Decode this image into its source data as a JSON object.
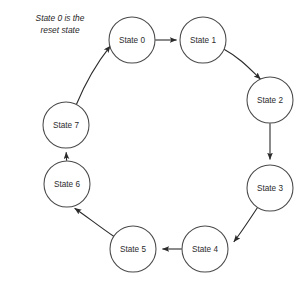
{
  "diagram": {
    "type": "state-transition-ring",
    "caption": "State 0 is the\nreset state",
    "caption_line_1": "State 0 is the",
    "caption_line_2": "reset state",
    "background_color": "#ffffff",
    "node_stroke_color": "#4a4a4a",
    "node_fill_color": "#ffffff",
    "edge_color": "#2b2b2b",
    "label_color": "#2b2b2b",
    "node_radius": 23,
    "nodes": [
      {
        "id": "state-0",
        "label": "State 0",
        "cx": 132,
        "cy": 40
      },
      {
        "id": "state-1",
        "label": "State 1",
        "cx": 203,
        "cy": 40
      },
      {
        "id": "state-2",
        "label": "State 2",
        "cx": 270,
        "cy": 100
      },
      {
        "id": "state-3",
        "label": "State 3",
        "cx": 270,
        "cy": 188
      },
      {
        "id": "state-4",
        "label": "State 4",
        "cx": 205,
        "cy": 249
      },
      {
        "id": "state-5",
        "label": "State 5",
        "cx": 133,
        "cy": 249
      },
      {
        "id": "state-6",
        "label": "State 6",
        "cx": 67,
        "cy": 184
      },
      {
        "id": "state-7",
        "label": "State 7",
        "cx": 66,
        "cy": 125
      }
    ],
    "edges": [
      {
        "id": "edge-0-1",
        "from": "State 0",
        "to": "State 1",
        "style": "straight",
        "label": ""
      },
      {
        "id": "edge-1-2",
        "from": "State 1",
        "to": "State 2",
        "style": "curved",
        "label": ""
      },
      {
        "id": "edge-2-3",
        "from": "State 2",
        "to": "State 3",
        "style": "straight",
        "label": ""
      },
      {
        "id": "edge-3-4",
        "from": "State 3",
        "to": "State 4",
        "style": "curved",
        "label": ""
      },
      {
        "id": "edge-4-5",
        "from": "State 4",
        "to": "State 5",
        "style": "straight",
        "label": ""
      },
      {
        "id": "edge-5-6",
        "from": "State 5",
        "to": "State 6",
        "style": "curved",
        "label": ""
      },
      {
        "id": "edge-6-7",
        "from": "State 6",
        "to": "State 7",
        "style": "straight",
        "label": ""
      },
      {
        "id": "edge-7-0",
        "from": "State 7",
        "to": "State 0",
        "style": "curved",
        "label": ""
      }
    ]
  }
}
